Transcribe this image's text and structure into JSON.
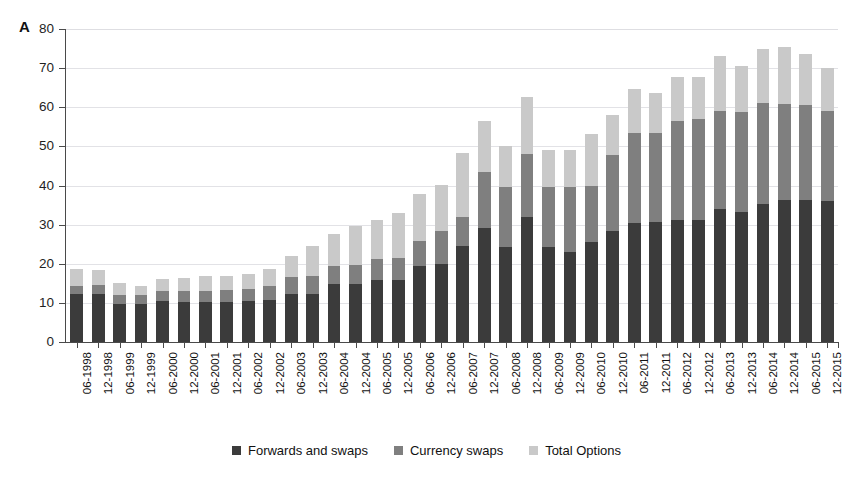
{
  "figure": {
    "panel_letter": "A",
    "background_color": "#ffffff"
  },
  "legend": {
    "position": "bottom-center",
    "items": [
      {
        "label": "Forwards and swaps",
        "color": "#3b3b3b",
        "swatch": "square-swatch"
      },
      {
        "label": "Currency swaps",
        "color": "#7f7f7f",
        "swatch": "square-swatch"
      },
      {
        "label": "Total Options",
        "color": "#c9c9c9",
        "swatch": "square-swatch"
      }
    ]
  },
  "axes": {
    "y_ticks": [
      "0",
      "10",
      "20",
      "30",
      "40",
      "50",
      "60",
      "70",
      "80"
    ],
    "x_label": "",
    "y_label": ""
  },
  "chart_data": {
    "type": "bar",
    "subtype": "stacked-vertical",
    "title": "",
    "xlabel": "",
    "ylabel": "",
    "ylim": [
      0,
      80
    ],
    "ytick_step": 10,
    "grid": true,
    "grid_axis": "y",
    "legend_position": "bottom-center",
    "categories": [
      "06-1998",
      "12-1998",
      "06-1999",
      "12-1999",
      "06-2000",
      "12-2000",
      "06-2001",
      "12-2001",
      "06-2002",
      "12-2002",
      "06-2003",
      "12-2003",
      "06-2004",
      "12-2004",
      "06-2005",
      "12-2005",
      "06-2006",
      "12-2006",
      "06-2007",
      "12-2007",
      "06-2008",
      "12-2008",
      "06-2009",
      "12-2009",
      "06-2010",
      "12-2010",
      "06-2011",
      "12-2011",
      "06-2012",
      "12-2012",
      "06-2013",
      "12-2013",
      "06-2014",
      "12-2014",
      "06-2015",
      "12-2015"
    ],
    "series": [
      {
        "name": "Forwards and swaps",
        "color": "#3b3b3b",
        "values": [
          12.2,
          12.4,
          9.6,
          9.6,
          10.5,
          10.3,
          10.3,
          10.3,
          10.4,
          10.7,
          12.4,
          12.4,
          14.9,
          14.9,
          15.8,
          15.8,
          19.4,
          19.9,
          24.5,
          29.1,
          24.3,
          31.9,
          24.2,
          23.1,
          25.6,
          28.4,
          30.5,
          30.6,
          31.1,
          31.1,
          34.0,
          33.2,
          35.2,
          36.3,
          36.4,
          36.0
        ]
      },
      {
        "name": "Currency swaps",
        "color": "#7f7f7f",
        "values": [
          2.2,
          2.2,
          2.3,
          2.3,
          2.6,
          2.7,
          2.8,
          3.0,
          3.2,
          3.5,
          4.1,
          4.4,
          4.5,
          4.8,
          5.5,
          5.8,
          6.5,
          8.4,
          7.4,
          14.3,
          15.3,
          16.2,
          15.3,
          16.5,
          14.4,
          19.3,
          23.0,
          22.8,
          25.5,
          25.9,
          25.0,
          25.6,
          25.8,
          24.6,
          24.2,
          23.0
        ]
      },
      {
        "name": "Total Options",
        "color": "#c9c9c9",
        "values": [
          4.3,
          3.7,
          3.2,
          2.4,
          3.0,
          3.3,
          3.8,
          3.6,
          3.9,
          4.4,
          5.6,
          7.7,
          8.3,
          9.9,
          9.8,
          11.3,
          11.9,
          11.9,
          16.5,
          13.0,
          10.6,
          14.6,
          9.5,
          9.6,
          13.1,
          10.3,
          11.1,
          10.3,
          11.2,
          10.7,
          14.1,
          11.7,
          14.0,
          14.4,
          13.1,
          11.0
        ]
      }
    ],
    "totals": [
      18.7,
      18.3,
      15.1,
      14.3,
      16.1,
      16.3,
      16.9,
      16.9,
      17.5,
      18.6,
      22.1,
      24.5,
      27.7,
      29.6,
      31.1,
      32.9,
      37.8,
      40.2,
      48.4,
      56.4,
      50.2,
      62.7,
      49.0,
      49.2,
      53.1,
      58.0,
      64.6,
      63.7,
      67.8,
      67.7,
      73.1,
      70.5,
      75.0,
      75.3,
      73.7,
      70.0
    ]
  }
}
